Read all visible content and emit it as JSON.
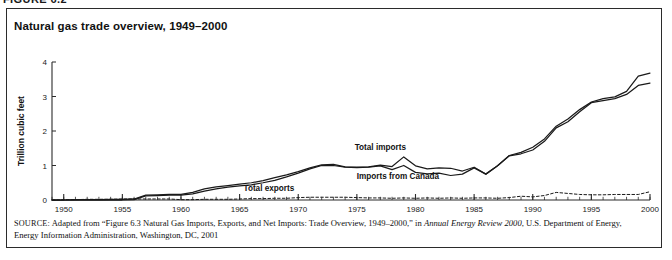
{
  "figure_header": "FIGURE 6.2",
  "title": "Natural gas trade overview, 1949–2000",
  "source": {
    "label": "SOURCE:",
    "text_before_italic": " Adapted from “Figure 6.3 Natural Gas Imports, Exports, and Net Imports: Trade Overview, 1949–2000,” in ",
    "italic_title": "Annual Energy Review 2000",
    "text_after_italic": ", U.S. Department of Energy, Energy Information Administration, Washington, DC, 2001"
  },
  "chart_data": {
    "type": "line",
    "title": "Natural gas trade overview, 1949–2000",
    "xlabel": "",
    "ylabel": "Trillion cubic feet",
    "xlim": [
      1949,
      2000
    ],
    "ylim": [
      0,
      4
    ],
    "yticks": [
      0,
      1,
      2,
      3,
      4
    ],
    "ytick_labels": [
      "0",
      "1",
      "2",
      "3",
      "4"
    ],
    "xticks": [
      1950,
      1955,
      1960,
      1965,
      1970,
      1975,
      1980,
      1985,
      1990,
      1995,
      2000
    ],
    "xtick_labels": [
      "1950",
      "1955",
      "1960",
      "1965",
      "1970",
      "1975",
      "1980",
      "1985",
      "1990",
      "1995",
      "2000"
    ],
    "minor_xtick_interval": 1,
    "grid": false,
    "legend_position": "inline-annotations",
    "x": [
      1949,
      1950,
      1951,
      1952,
      1953,
      1954,
      1955,
      1956,
      1957,
      1958,
      1959,
      1960,
      1961,
      1962,
      1963,
      1964,
      1965,
      1966,
      1967,
      1968,
      1969,
      1970,
      1971,
      1972,
      1973,
      1974,
      1975,
      1976,
      1977,
      1978,
      1979,
      1980,
      1981,
      1982,
      1983,
      1984,
      1985,
      1986,
      1987,
      1988,
      1989,
      1990,
      1991,
      1992,
      1993,
      1994,
      1995,
      1996,
      1997,
      1998,
      1999,
      2000
    ],
    "series": [
      {
        "name": "Total imports",
        "style": "solid",
        "color": "#1a1a1a",
        "label_text": "Total imports",
        "values": [
          0.0,
          0.0,
          0.01,
          0.01,
          0.01,
          0.02,
          0.02,
          0.03,
          0.14,
          0.15,
          0.16,
          0.16,
          0.22,
          0.32,
          0.38,
          0.42,
          0.46,
          0.5,
          0.56,
          0.65,
          0.73,
          0.82,
          0.93,
          1.02,
          1.03,
          0.96,
          0.95,
          0.96,
          1.01,
          0.97,
          1.25,
          0.99,
          0.9,
          0.93,
          0.92,
          0.84,
          0.95,
          0.75,
          0.99,
          1.29,
          1.38,
          1.53,
          1.77,
          2.14,
          2.35,
          2.62,
          2.84,
          2.94,
          2.99,
          3.15,
          3.59,
          3.68
        ]
      },
      {
        "name": "Imports from Canada",
        "style": "solid",
        "color": "#1a1a1a",
        "label_text": "Imports from Canada",
        "values": [
          0.0,
          0.0,
          0.0,
          0.0,
          0.0,
          0.0,
          0.0,
          0.01,
          0.12,
          0.13,
          0.14,
          0.14,
          0.18,
          0.26,
          0.32,
          0.37,
          0.41,
          0.44,
          0.5,
          0.57,
          0.67,
          0.78,
          0.9,
          1.0,
          1.0,
          0.95,
          0.94,
          0.95,
          0.99,
          0.88,
          1.0,
          0.8,
          0.76,
          0.78,
          0.71,
          0.75,
          0.93,
          0.75,
          0.99,
          1.28,
          1.34,
          1.45,
          1.7,
          2.09,
          2.27,
          2.56,
          2.82,
          2.88,
          2.94,
          3.06,
          3.32,
          3.39
        ]
      },
      {
        "name": "Total exports",
        "style": "dashed",
        "color": "#1a1a1a",
        "label_text": "Total exports",
        "values": [
          0.0,
          0.01,
          0.01,
          0.02,
          0.02,
          0.02,
          0.03,
          0.03,
          0.03,
          0.03,
          0.03,
          0.01,
          0.01,
          0.02,
          0.02,
          0.02,
          0.03,
          0.04,
          0.04,
          0.05,
          0.05,
          0.07,
          0.08,
          0.08,
          0.08,
          0.08,
          0.07,
          0.06,
          0.06,
          0.05,
          0.06,
          0.05,
          0.06,
          0.05,
          0.06,
          0.05,
          0.06,
          0.06,
          0.05,
          0.07,
          0.11,
          0.09,
          0.13,
          0.22,
          0.19,
          0.16,
          0.15,
          0.15,
          0.16,
          0.16,
          0.16,
          0.24
        ]
      }
    ],
    "annotations": [
      {
        "text": "Total imports",
        "x": 1977.0,
        "y": 1.45
      },
      {
        "text": "Imports from Canada",
        "x": 1978.5,
        "y": 0.62
      },
      {
        "text": "Total exports",
        "x": 1967.5,
        "y": 0.26
      }
    ]
  }
}
